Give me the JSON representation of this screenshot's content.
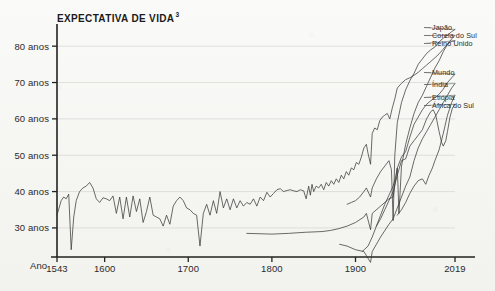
{
  "chart_data": {
    "type": "line",
    "title": "EXPECTATIVA DE VIDA",
    "title_superscript": "3",
    "xlabel": "Ano",
    "ylabel": "",
    "xlim": [
      1543,
      2019
    ],
    "ylim": [
      22,
      85
    ],
    "grid": true,
    "legend_position": "right-inline",
    "xticks": [
      1543,
      1600,
      1700,
      1800,
      1900,
      2019
    ],
    "xticklabels": [
      "1543",
      "1600",
      "1700",
      "1800",
      "1900",
      "2019"
    ],
    "yticks": [
      30,
      40,
      50,
      60,
      70,
      80
    ],
    "yticklabels": [
      "30 anos",
      "40 anos",
      "50 anos",
      "60 anos",
      "70 anos",
      "80 anos"
    ],
    "series": [
      {
        "name": "Reino Unido",
        "label": "Reino Unido",
        "x": [
          1543,
          1548,
          1551,
          1554,
          1557,
          1560,
          1563,
          1566,
          1570,
          1574,
          1578,
          1582,
          1586,
          1590,
          1594,
          1598,
          1602,
          1606,
          1610,
          1614,
          1618,
          1622,
          1626,
          1630,
          1634,
          1638,
          1642,
          1646,
          1650,
          1654,
          1658,
          1662,
          1666,
          1670,
          1674,
          1678,
          1682,
          1686,
          1690,
          1694,
          1698,
          1702,
          1706,
          1710,
          1714,
          1718,
          1722,
          1726,
          1730,
          1734,
          1738,
          1742,
          1746,
          1750,
          1754,
          1758,
          1762,
          1766,
          1770,
          1774,
          1778,
          1782,
          1786,
          1790,
          1794,
          1798,
          1802,
          1806,
          1810,
          1814,
          1818,
          1822,
          1826,
          1830,
          1834,
          1838,
          1841,
          1844,
          1846,
          1848,
          1850,
          1853,
          1856,
          1859,
          1862,
          1865,
          1868,
          1871,
          1874,
          1877,
          1880,
          1883,
          1886,
          1889,
          1892,
          1895,
          1898,
          1901,
          1904,
          1907,
          1910,
          1913,
          1915,
          1918,
          1920,
          1923,
          1926,
          1929,
          1932,
          1935,
          1938,
          1941,
          1944,
          1947,
          1950,
          1955,
          1960,
          1965,
          1970,
          1975,
          1980,
          1985,
          1990,
          1995,
          2000,
          2005,
          2010,
          2015,
          2019
        ],
        "y": [
          33.5,
          37.5,
          38.5,
          38.0,
          39.3,
          24.0,
          33.0,
          37.5,
          40.0,
          41.0,
          41.5,
          42.5,
          41.0,
          38.0,
          37.0,
          38.3,
          38.0,
          37.5,
          38.8,
          34.0,
          38.5,
          32.5,
          38.5,
          33.0,
          38.8,
          34.5,
          38.0,
          31.5,
          34.5,
          38.5,
          33.5,
          33.0,
          32.5,
          30.5,
          33.5,
          31.0,
          36.0,
          37.5,
          38.5,
          37.5,
          35.5,
          35.0,
          34.0,
          33.5,
          25.0,
          34.0,
          36.5,
          33.5,
          37.5,
          34.0,
          40.0,
          35.5,
          38.0,
          35.0,
          38.0,
          35.5,
          37.5,
          36.0,
          37.0,
          36.5,
          38.0,
          36.0,
          38.5,
          37.5,
          39.8,
          38.5,
          39.5,
          40.5,
          40.8,
          40.0,
          40.3,
          40.5,
          40.2,
          40.0,
          40.5,
          40.2,
          38.0,
          41.5,
          39.0,
          42.0,
          40.0,
          41.5,
          41.0,
          42.0,
          40.5,
          42.5,
          41.5,
          43.0,
          42.0,
          43.5,
          42.5,
          44.5,
          43.5,
          45.5,
          44.5,
          46.5,
          46.0,
          48.0,
          47.5,
          49.5,
          52.0,
          53.0,
          50.5,
          47.5,
          56.0,
          57.5,
          57.0,
          59.5,
          60.5,
          61.0,
          61.5,
          60.0,
          63.0,
          65.5,
          68.5,
          69.8,
          70.8,
          71.3,
          72.0,
          72.8,
          73.8,
          74.8,
          75.8,
          76.8,
          77.9,
          79.2,
          80.6,
          81.3,
          81.5
        ]
      },
      {
        "name": "Japão",
        "label": "Japão",
        "x": [
          1890,
          1895,
          1900,
          1905,
          1910,
          1913,
          1918,
          1920,
          1925,
          1930,
          1935,
          1940,
          1943,
          1945,
          1947,
          1950,
          1955,
          1960,
          1965,
          1970,
          1975,
          1980,
          1985,
          1990,
          1995,
          2000,
          2005,
          2010,
          2015,
          2019
        ],
        "y": [
          36.5,
          37.0,
          37.5,
          38.5,
          40.0,
          41.0,
          38.5,
          41.0,
          43.5,
          45.5,
          47.0,
          48.5,
          46.0,
          32.0,
          50.0,
          59.0,
          64.5,
          68.0,
          70.5,
          72.5,
          75.0,
          76.5,
          78.0,
          79.0,
          79.8,
          81.2,
          82.2,
          83.0,
          84.0,
          84.6
        ]
      },
      {
        "name": "Coreia do Sul",
        "label": "Coreia do Sul",
        "x": [
          1908,
          1915,
          1920,
          1925,
          1930,
          1935,
          1940,
          1945,
          1948,
          1950,
          1952,
          1955,
          1960,
          1965,
          1970,
          1975,
          1980,
          1985,
          1990,
          1995,
          2000,
          2005,
          2010,
          2015,
          2019
        ],
        "y": [
          23.5,
          25.0,
          27.5,
          30.5,
          33.5,
          36.5,
          39.0,
          41.5,
          44.0,
          46.5,
          34.0,
          47.0,
          53.0,
          57.5,
          61.5,
          64.5,
          66.5,
          69.0,
          71.5,
          74.0,
          76.0,
          78.5,
          80.5,
          82.0,
          83.0
        ]
      },
      {
        "name": "Mundo",
        "label": "Mundo",
        "x": [
          1770,
          1800,
          1820,
          1840,
          1860,
          1870,
          1880,
          1890,
          1900,
          1910,
          1913,
          1918,
          1920,
          1930,
          1940,
          1945,
          1950,
          1955,
          1960,
          1965,
          1970,
          1975,
          1980,
          1985,
          1990,
          1995,
          2000,
          2005,
          2010,
          2015,
          2019
        ],
        "y": [
          28.5,
          28.3,
          28.5,
          28.8,
          29.0,
          29.3,
          29.8,
          30.5,
          31.5,
          33.0,
          34.0,
          29.5,
          34.0,
          36.0,
          38.0,
          38.5,
          46.5,
          49.5,
          51.0,
          55.0,
          58.5,
          60.5,
          62.5,
          64.0,
          65.0,
          65.8,
          66.8,
          68.2,
          70.0,
          71.3,
          72.3
        ]
      },
      {
        "name": "Índia",
        "label": "Índia",
        "x": [
          1881,
          1890,
          1900,
          1910,
          1918,
          1920,
          1930,
          1940,
          1945,
          1950,
          1955,
          1960,
          1965,
          1970,
          1975,
          1980,
          1985,
          1990,
          1995,
          2000,
          2005,
          2010,
          2015,
          2019
        ],
        "y": [
          25.5,
          25.0,
          24.0,
          23.5,
          20.5,
          23.5,
          27.5,
          31.0,
          32.5,
          35.5,
          38.5,
          41.5,
          44.0,
          48.5,
          52.0,
          54.5,
          56.5,
          58.5,
          60.5,
          62.5,
          64.5,
          66.5,
          68.5,
          69.7
        ]
      },
      {
        "name": "Etiópia",
        "label": "Etiópia",
        "x": [
          1950,
          1955,
          1960,
          1965,
          1970,
          1975,
          1980,
          1984,
          1988,
          1992,
          1995,
          2000,
          2005,
          2010,
          2015,
          2019
        ],
        "y": [
          33.5,
          35.0,
          37.0,
          39.5,
          41.5,
          43.0,
          43.5,
          42.0,
          44.5,
          46.5,
          48.5,
          51.5,
          56.0,
          61.0,
          64.5,
          66.5
        ]
      },
      {
        "name": "África do Sul",
        "label": "África do Sul",
        "x": [
          1925,
          1930,
          1935,
          1940,
          1945,
          1950,
          1955,
          1960,
          1965,
          1970,
          1975,
          1980,
          1985,
          1990,
          1993,
          1996,
          2000,
          2003,
          2005,
          2008,
          2010,
          2013,
          2016,
          2019
        ],
        "y": [
          30.5,
          32.5,
          35.0,
          37.5,
          40.0,
          44.5,
          48.5,
          49.0,
          52.5,
          54.0,
          55.5,
          57.0,
          60.0,
          62.0,
          62.5,
          61.0,
          56.5,
          53.5,
          52.5,
          54.0,
          56.5,
          60.5,
          63.0,
          64.0
        ]
      }
    ],
    "legend_labels": [
      "Japão",
      "Coreia do Sul",
      "Reino Unido",
      "Mundo",
      "Índia",
      "Etiópia",
      "África do Sul"
    ]
  }
}
